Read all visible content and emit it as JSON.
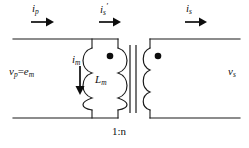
{
  "figure": {
    "background_color": "#ffffff",
    "wire_color": "#1a1a1a",
    "label_color": "#111111",
    "width": 249,
    "height": 148
  },
  "labels": {
    "primary_current": {
      "symbol": "i",
      "subscript": "p",
      "prime": "",
      "text": "i_p"
    },
    "secondary_referred_current": {
      "symbol": "i",
      "subscript": "s",
      "prime": "′",
      "text": "i_s'"
    },
    "secondary_current": {
      "symbol": "i",
      "subscript": "s",
      "prime": "",
      "text": "i_s"
    },
    "primary_voltage": {
      "text": "v_p = e_m",
      "symbol_1": "v",
      "subscript_1": "p",
      "equals": "=",
      "symbol_2": "e",
      "subscript_2": "m"
    },
    "magnetizing_current": {
      "symbol": "i",
      "subscript": "m",
      "text": "i_m"
    },
    "magnetizing_inductance": {
      "symbol": "L",
      "subscript": "m",
      "text": "L_m"
    },
    "secondary_voltage": {
      "symbol": "v",
      "subscript": "s",
      "text": "v_s"
    },
    "turns_ratio": "1:n"
  },
  "components": {
    "magnetizing_inductor": {
      "name": "L_m",
      "position": "shunt-branch"
    },
    "ideal_transformer": {
      "ratio": "1:n",
      "core_lines": 2,
      "dots": 2
    },
    "polarity_dot_primary": {
      "side": "primary-top"
    },
    "polarity_dot_secondary": {
      "side": "secondary-top"
    }
  },
  "arrows": {
    "primary_current_arrow": {
      "direction": "right"
    },
    "secondary_referred_current_arrow": {
      "direction": "right"
    },
    "secondary_current_arrow": {
      "direction": "right"
    },
    "magnetizing_current_arrow": {
      "direction": "down"
    }
  }
}
